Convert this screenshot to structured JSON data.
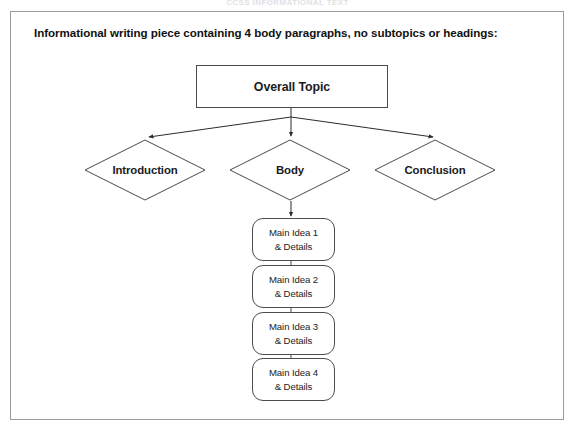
{
  "page": {
    "top_cut_text": "CCSS INFORMATIONAL TEXT"
  },
  "figure": {
    "caption": "Informational writing piece containing 4 body paragraphs, no subtopics or headings:",
    "topic": {
      "label": "Overall Topic",
      "shape": "rectangle"
    },
    "branches": [
      {
        "label": "Introduction",
        "shape": "diamond"
      },
      {
        "label": "Body",
        "shape": "diamond"
      },
      {
        "label": "Conclusion",
        "shape": "diamond"
      }
    ],
    "body_children": [
      {
        "line1": "Main Idea 1",
        "line2": "& Details",
        "shape": "rounded-rectangle"
      },
      {
        "line1": "Main Idea 2",
        "line2": "& Details",
        "shape": "rounded-rectangle"
      },
      {
        "line1": "Main Idea 3",
        "line2": "& Details",
        "shape": "rounded-rectangle"
      },
      {
        "line1": "Main Idea 4",
        "line2": "& Details",
        "shape": "rounded-rectangle"
      }
    ],
    "colors": {
      "frame_border": "#9a9a9e",
      "shape_border": "#4a4a4e",
      "connector": "#2b2b2b",
      "text": "#1b1b1b",
      "background": "#ffffff"
    }
  }
}
